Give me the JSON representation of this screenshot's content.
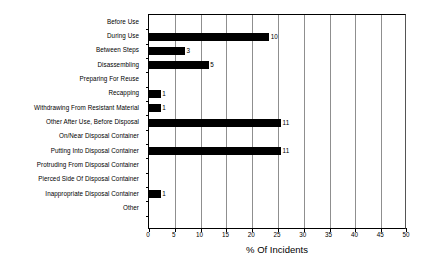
{
  "chart_data": {
    "type": "bar",
    "orientation": "horizontal",
    "title": "",
    "xlabel": "% Of Incidents",
    "ylabel": "",
    "xlim": [
      0,
      50
    ],
    "xticks": [
      0,
      5,
      10,
      15,
      20,
      25,
      30,
      35,
      40,
      45,
      50
    ],
    "grid": true,
    "legend": null,
    "bar_color": "#000000",
    "categories": [
      "Before Use",
      "During Use",
      "Between Steps",
      "Disassembling",
      "Preparing For Reuse",
      "Recapping",
      "Withdrawing From Resistant Material",
      "Other After Use, Before Disposal",
      "On/Near Disposal Container",
      "Putting Into Disposal Container",
      "Protruding From Disposal Container",
      "Pierced Side Of Disposal Container",
      "Inappropriate Disposal Container",
      "Other"
    ],
    "values": [
      0,
      23.3,
      7.0,
      11.6,
      0,
      2.3,
      2.3,
      25.6,
      0,
      25.6,
      0,
      0,
      2.3,
      0
    ],
    "data_labels": [
      "",
      "10",
      "3",
      "5",
      "",
      "1",
      "1",
      "11",
      "",
      "11",
      "",
      "",
      "1",
      ""
    ]
  }
}
